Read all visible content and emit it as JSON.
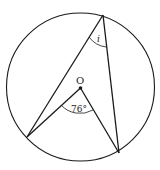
{
  "diagram": {
    "type": "circle-inscribed-angle",
    "circle": {
      "cx": 80.5,
      "cy": 87,
      "r": 74
    },
    "center_label": "O",
    "points": {
      "top": [
        103,
        15
      ],
      "left": [
        27,
        137
      ],
      "right": [
        119,
        153
      ],
      "center": [
        80.5,
        88
      ]
    },
    "central_angle_label": "76°",
    "inscribed_angle_label": "i",
    "stroke_color": "#1a1a1a"
  }
}
